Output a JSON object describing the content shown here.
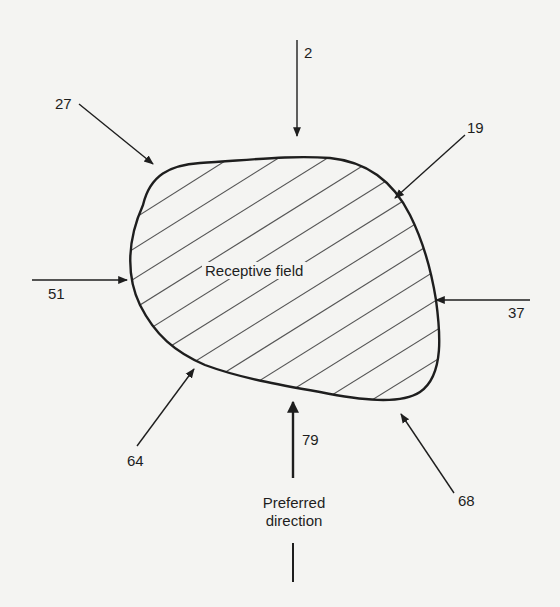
{
  "figure": {
    "receptive_field_label": "Receptive field",
    "preferred_direction_label_line1": "Preferred",
    "preferred_direction_label_line2": "direction",
    "stroke_color": "#1e1e1e",
    "hatch_color": "#555555",
    "background_color": "#f4f4f2"
  },
  "directions": [
    {
      "id": "top",
      "direction": "down",
      "value": "2"
    },
    {
      "id": "top-right",
      "direction": "down-left",
      "value": "19"
    },
    {
      "id": "right",
      "direction": "left",
      "value": "37"
    },
    {
      "id": "bottom-right",
      "direction": "up-left",
      "value": "68"
    },
    {
      "id": "bottom",
      "direction": "up",
      "value": "79"
    },
    {
      "id": "bottom-left",
      "direction": "up-right",
      "value": "64"
    },
    {
      "id": "left",
      "direction": "right",
      "value": "51"
    },
    {
      "id": "top-left",
      "direction": "down-right",
      "value": "27"
    }
  ]
}
